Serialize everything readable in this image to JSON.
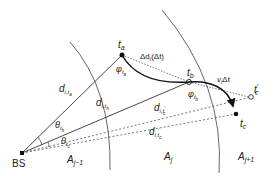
{
  "diagram": {
    "colors": {
      "line": "#333333",
      "arc": "#555555",
      "dash": "#555555",
      "trajectory": "#111111",
      "text": "#222222"
    },
    "nodes": {
      "bs": {
        "label": "BS",
        "x": 22,
        "y": 153
      },
      "ta": {
        "label": "t",
        "sub": "a",
        "x": 122,
        "y": 55
      },
      "tb": {
        "label": "t",
        "sub": "b",
        "x": 189,
        "y": 82
      },
      "tc": {
        "label": "t",
        "sub": "c",
        "x": 236,
        "y": 114
      },
      "tc_prime": {
        "label": "t",
        "sub": "c",
        "sup": "′",
        "x": 251,
        "y": 97
      }
    },
    "labels": {
      "delta_d": "Δd",
      "delta_d_sub": "i",
      "delta_d_arg": "(Δt)",
      "velocity": "v",
      "velocity_sub": "i",
      "velocity_tail": "Δt",
      "phi": "φ",
      "phi_ta_sub": "t",
      "phi_ta_subsub": "a",
      "phi_tb_sub": "t",
      "phi_tb_subsub": "b",
      "theta": "θ",
      "theta_tb_sub": "t",
      "theta_tb_subsub": "b",
      "theta_tc_sub": "t",
      "theta_tc_subsub": "c",
      "d": "d",
      "d_ta_sub": "i,t",
      "d_ta_subsub": "a",
      "d_tb_sub": "i,t",
      "d_tb_subsub": "b",
      "d_tcp_sub": "i,t",
      "d_tcp_subsub": "c",
      "d_tcp_prime": "′",
      "d_tc_sub": "i,t",
      "d_tc_subsub": "c"
    },
    "regions": [
      {
        "name": "A",
        "sub": "j−1"
      },
      {
        "name": "A",
        "sub": "j"
      },
      {
        "name": "A",
        "sub": "j+1"
      }
    ]
  }
}
